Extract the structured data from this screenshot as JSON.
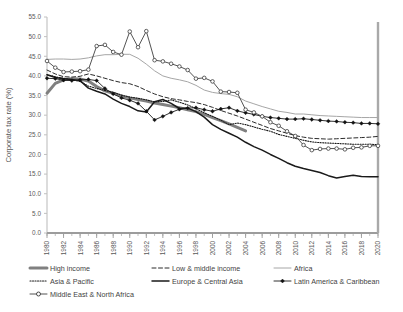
{
  "chart_data": {
    "type": "line",
    "title": "",
    "xlabel": "",
    "ylabel": "Corporate tax rate (%)",
    "ylim": [
      0.0,
      55.0
    ],
    "yticks": [
      "0.0",
      "5.0",
      "10.0",
      "15.0",
      "20.0",
      "25.0",
      "30.0",
      "35.0",
      "40.0",
      "45.0",
      "50.0",
      "55.0"
    ],
    "grid": false,
    "legend_position": "bottom",
    "xlim": [
      1980,
      2020
    ],
    "x": [
      1980,
      1981,
      1982,
      1983,
      1984,
      1985,
      1986,
      1987,
      1988,
      1989,
      1990,
      1991,
      1992,
      1993,
      1994,
      1995,
      1996,
      1997,
      1998,
      1999,
      2000,
      2001,
      2002,
      2003,
      2004,
      2005,
      2006,
      2007,
      2008,
      2009,
      2010,
      2011,
      2012,
      2013,
      2014,
      2015,
      2016,
      2017,
      2018,
      2019,
      2020
    ],
    "xticks": [
      "1980",
      "1982",
      "1984",
      "1986",
      "1988",
      "1990",
      "1992",
      "1994",
      "1996",
      "1998",
      "2000",
      "2002",
      "2004",
      "2006",
      "2008",
      "2010",
      "2012",
      "2014",
      "2016",
      "2018",
      "2020"
    ],
    "series": [
      {
        "name": "High income",
        "style": "solid-thick-gray",
        "color": "#808080",
        "values": [
          35.6,
          38.1,
          39.0,
          39.3,
          39.2,
          38.7,
          37.3,
          36.2,
          35.6,
          34.9,
          34.4,
          34.0,
          33.6,
          33.1,
          32.7,
          32.3,
          31.9,
          31.4,
          30.9,
          30.2,
          29.4,
          28.6,
          27.8,
          26.9,
          26.0,
          null,
          null,
          null,
          null,
          null,
          null,
          null,
          null,
          null,
          null,
          null,
          null,
          null,
          null,
          null,
          null
        ]
      },
      {
        "name": "Low & middle income",
        "style": "dashed",
        "color": "#2b2b2b",
        "values": [
          41.5,
          40.5,
          39.8,
          39.7,
          39.9,
          40.5,
          40.0,
          39.4,
          38.8,
          38.3,
          38.0,
          37.3,
          36.3,
          35.4,
          34.7,
          34.2,
          33.9,
          33.5,
          33.2,
          32.7,
          32.0,
          31.2,
          30.5,
          29.8,
          29.0,
          28.2,
          27.4,
          26.6,
          26.0,
          25.4,
          24.8,
          24.4,
          24.1,
          24.0,
          23.9,
          24.0,
          24.1,
          24.2,
          24.3,
          24.4,
          24.6
        ]
      },
      {
        "name": "Africa",
        "style": "solid-thin-gray",
        "color": "#a6a6a6",
        "values": [
          44.2,
          44.3,
          44.3,
          44.2,
          44.3,
          44.6,
          45.1,
          45.4,
          45.4,
          45.5,
          45.5,
          44.5,
          43.0,
          41.3,
          40.0,
          39.4,
          39.0,
          38.5,
          37.6,
          36.4,
          35.8,
          35.5,
          35.3,
          34.7,
          33.6,
          32.9,
          32.2,
          31.6,
          31.0,
          30.7,
          30.3,
          30.3,
          30.1,
          29.9,
          29.8,
          29.7,
          29.6,
          29.5,
          29.4,
          29.4,
          29.4
        ]
      },
      {
        "name": "Asia & Pacific",
        "style": "dotted",
        "color": "#1a1a1a",
        "values": [
          40.3,
          39.8,
          39.4,
          39.0,
          38.6,
          37.4,
          36.8,
          36.3,
          35.8,
          35.1,
          34.6,
          34.3,
          33.9,
          33.4,
          33.5,
          33.9,
          33.3,
          32.6,
          31.7,
          30.6,
          29.7,
          28.7,
          27.6,
          28.0,
          27.6,
          27.0,
          26.4,
          25.9,
          25.1,
          24.6,
          24.1,
          23.6,
          23.2,
          23.0,
          22.9,
          22.8,
          22.7,
          22.6,
          22.6,
          22.6,
          22.5
        ]
      },
      {
        "name": "Europe & Central Asia",
        "style": "solid-thick-dark",
        "color": "#1a1a1a",
        "values": [
          40.3,
          39.6,
          39.3,
          39.1,
          38.8,
          36.9,
          36.1,
          35.4,
          34.1,
          33.0,
          32.2,
          31.1,
          30.8,
          33.4,
          34.0,
          33.0,
          31.7,
          31.8,
          30.9,
          29.5,
          27.6,
          26.4,
          25.4,
          24.4,
          23.1,
          22.0,
          21.1,
          20.0,
          19.0,
          17.9,
          17.0,
          16.4,
          15.9,
          15.4,
          14.6,
          14.0,
          14.4,
          14.7,
          14.4,
          14.3,
          14.3
        ]
      },
      {
        "name": "Latin America & Caribbean",
        "style": "marker-diamond",
        "color": "#1a1a1a",
        "values": [
          39.4,
          39.3,
          38.9,
          38.8,
          39.0,
          39.1,
          38.8,
          36.8,
          35.4,
          34.4,
          33.8,
          33.0,
          31.0,
          28.8,
          29.7,
          30.7,
          31.5,
          31.8,
          31.9,
          31.4,
          31.0,
          31.6,
          31.9,
          31.1,
          30.6,
          30.2,
          29.7,
          29.4,
          29.2,
          29.0,
          29.0,
          29.1,
          28.9,
          28.7,
          28.5,
          28.4,
          28.2,
          28.1,
          27.9,
          27.9,
          27.8
        ]
      },
      {
        "name": "Middle East & North Africa",
        "style": "marker-circle",
        "color": "#404040",
        "values": [
          43.8,
          42.1,
          41.0,
          41.1,
          41.2,
          41.6,
          47.6,
          47.9,
          46.1,
          45.4,
          51.3,
          47.3,
          51.4,
          44.0,
          43.7,
          43.1,
          42.4,
          41.5,
          39.3,
          39.5,
          38.6,
          36.0,
          35.9,
          35.7,
          31.4,
          30.7,
          29.7,
          28.2,
          27.3,
          25.9,
          24.7,
          22.4,
          21.1,
          21.4,
          21.5,
          21.5,
          21.3,
          21.7,
          21.8,
          22.2,
          22.2
        ]
      }
    ]
  },
  "legend": {
    "items": [
      {
        "label": "High income"
      },
      {
        "label": "Low & middle income"
      },
      {
        "label": "Africa"
      },
      {
        "label": "Asia & Pacific"
      },
      {
        "label": "Europe & Central Asia"
      },
      {
        "label": "Latin America & Caribbean"
      },
      {
        "label": "Middle East & North Africa"
      }
    ]
  }
}
